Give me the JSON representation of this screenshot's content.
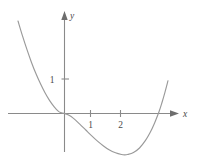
{
  "figure": {
    "kind": "cartesian-graph",
    "background_color": "#ffffff",
    "curve_color": "#9a9a9a",
    "axis_color": "#8a8a8a",
    "label_color": "#4a4a4a"
  },
  "axes": {
    "x_axis_label": "x",
    "y_axis_label": "y",
    "x_arrow": "arrow-right",
    "y_arrow": "arrow-up"
  },
  "ticks": {
    "x": [
      {
        "value": 1,
        "label": "1"
      },
      {
        "value": 2,
        "label": "2"
      }
    ],
    "y": [
      {
        "value": 1,
        "label": "1"
      }
    ]
  },
  "chart_data": {
    "type": "line",
    "title": "",
    "xlabel": "x",
    "ylabel": "y",
    "grid": false,
    "legend": "none",
    "xlim": [
      -1.55,
      3.95
    ],
    "ylim": [
      -1.25,
      2.7
    ],
    "x_ticks": [
      1,
      2
    ],
    "x_tick_labels": [
      "1",
      "2"
    ],
    "y_ticks": [
      1
    ],
    "y_tick_labels": [
      "1"
    ],
    "annotations": [
      "curve is tangent to the x-axis at the origin",
      "local minimum near x = 2.0",
      "curve rises steeply and crosses the x-axis near x = 3.15"
    ],
    "series": [
      {
        "name": "curve",
        "x": [
          -1.55,
          -1.4,
          -1.25,
          -1.1,
          -0.95,
          -0.8,
          -0.65,
          -0.5,
          -0.35,
          -0.2,
          -0.1,
          0.0,
          0.15,
          0.3,
          0.5,
          0.7,
          0.9,
          1.1,
          1.3,
          1.5,
          1.7,
          1.9,
          2.0,
          2.1,
          2.3,
          2.5,
          2.7,
          2.85,
          3.0,
          3.15,
          3.25,
          3.35,
          3.45
        ],
        "y": [
          2.68,
          2.25,
          1.85,
          1.48,
          1.15,
          0.86,
          0.6,
          0.38,
          0.2,
          0.06,
          0.02,
          0.0,
          -0.05,
          -0.14,
          -0.3,
          -0.47,
          -0.64,
          -0.8,
          -0.94,
          -1.06,
          -1.14,
          -1.19,
          -1.2,
          -1.19,
          -1.13,
          -1.0,
          -0.78,
          -0.56,
          -0.28,
          0.05,
          0.32,
          0.62,
          0.95
        ]
      }
    ]
  }
}
